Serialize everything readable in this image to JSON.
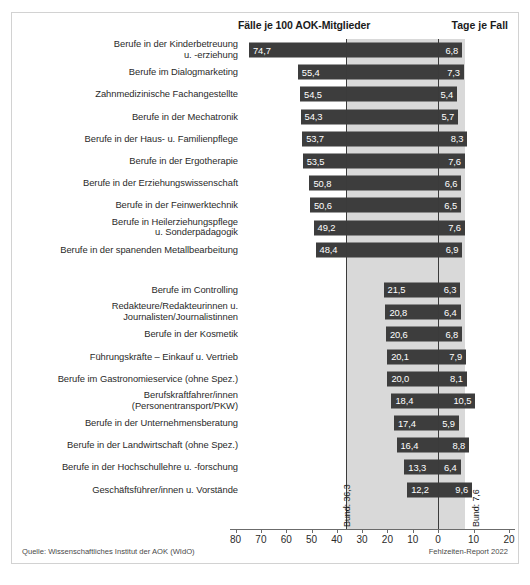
{
  "header": {
    "left_title": "Fälle je 100 AOK-Mitglieder",
    "right_title": "Tage je Fall"
  },
  "footer": {
    "source": "Quelle: Wissenschaftliches Institut der AOK (WIdO)",
    "report": "Fehlzeiten-Report 2022"
  },
  "reference": {
    "left_label": "Bund: 36,3",
    "right_label": "Bund: 7,6"
  },
  "axis": {
    "ticks": [
      "80",
      "70",
      "60",
      "50",
      "40",
      "30",
      "20",
      "10",
      "0",
      "10",
      "20"
    ]
  },
  "chart_data": {
    "type": "bar",
    "subtitle": "",
    "orientation": "horizontal-diverging",
    "xlabel": "",
    "ylabel": "",
    "legend_position": "top",
    "grid": false,
    "series": [
      {
        "name": "Fälle je 100 AOK-Mitglieder",
        "axis": "left",
        "direction": "left",
        "xlim": [
          0,
          80
        ],
        "reference_value": 36.3,
        "reference_label": "Bund: 36,3",
        "values": [
          74.7,
          55.4,
          54.5,
          54.3,
          53.7,
          53.5,
          50.8,
          50.6,
          49.2,
          48.4,
          21.5,
          20.8,
          20.6,
          20.1,
          20.0,
          18.4,
          17.4,
          16.4,
          13.3,
          12.2
        ],
        "value_labels": [
          "74,7",
          "55,4",
          "54,5",
          "54,3",
          "53,7",
          "53,5",
          "50,8",
          "50,6",
          "49,2",
          "48,4",
          "21,5",
          "20,8",
          "20,6",
          "20,1",
          "20,0",
          "18,4",
          "17,4",
          "16,4",
          "13,3",
          "12,2"
        ]
      },
      {
        "name": "Tage je Fall",
        "axis": "right",
        "direction": "right",
        "xlim": [
          0,
          20
        ],
        "reference_value": 7.6,
        "reference_label": "Bund: 7,6",
        "values": [
          6.8,
          7.3,
          5.4,
          5.7,
          8.3,
          7.6,
          6.6,
          6.5,
          7.6,
          6.9,
          6.3,
          6.4,
          6.8,
          7.9,
          8.1,
          10.5,
          5.9,
          8.8,
          6.4,
          9.6
        ],
        "value_labels": [
          "6,8",
          "7,3",
          "5,4",
          "5,7",
          "8,3",
          "7,6",
          "6,6",
          "6,5",
          "7,6",
          "6,9",
          "6,3",
          "6,4",
          "6,8",
          "7,9",
          "8,1",
          "10,5",
          "5,9",
          "8,8",
          "6,4",
          "9,6"
        ]
      }
    ],
    "categories": [
      "Berufe in der Kinderbetreuung\nu. -erziehung",
      "Berufe im Dialogmarketing",
      "Zahnmedizinische Fachangestellte",
      "Berufe in der Mechatronik",
      "Berufe in der Haus- u. Familienpflege",
      "Berufe in der Ergotherapie",
      "Berufe in der Erziehungswissenschaft",
      "Berufe in der Feinwerktechnik",
      "Berufe in Heilerziehungspflege\nu. Sonderpädagogik",
      "Berufe in der spanenden Metallbearbeitung",
      "Berufe im Controlling",
      "Redakteure/Redakteurinnen u.\nJournalisten/Journalistinnen",
      "Berufe in der Kosmetik",
      "Führungskräfte – Einkauf u. Vertrieb",
      "Berufe im Gastronomieservice (ohne Spez.)",
      "Berufskraftfahrer/innen\n(Personentransport/PKW)",
      "Berufe in der Unternehmensberatung",
      "Berufe in der Landwirtschaft (ohne Spez.)",
      "Berufe in der Hochschullehre u. -forschung",
      "Geschäftsführer/innen u. Vorstände"
    ],
    "group_break_after_index": 9
  },
  "colors": {
    "bar": "#3d3d3d",
    "band": "#d9d9d9",
    "refline": "#3b3b3b",
    "text": "#2a2a2a",
    "border": "#d2d2d2"
  }
}
